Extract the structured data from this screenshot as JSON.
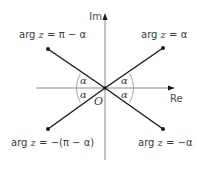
{
  "diagram": {
    "axes": {
      "x_label": "Re",
      "y_label": "Im",
      "origin_label": "O"
    },
    "angle_label": "α",
    "rays": [
      {
        "position": "top-right",
        "label_prefix": "arg",
        "label_var": "z",
        "label_rest": " = α"
      },
      {
        "position": "top-left",
        "label_prefix": "arg",
        "label_var": "z",
        "label_rest": " = π − α"
      },
      {
        "position": "bottom-left",
        "label_prefix": "arg",
        "label_var": "z",
        "label_rest": " = −(π − α)"
      },
      {
        "position": "bottom-right",
        "label_prefix": "arg",
        "label_var": "z",
        "label_rest": " = −α"
      }
    ],
    "colors": {
      "axis": "#8a8a8a",
      "ray": "#1a1a1a",
      "arc": "#9a9a9a",
      "text": "#3a3a3a"
    }
  }
}
